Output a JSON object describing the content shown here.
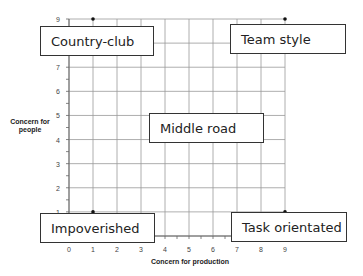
{
  "chart_data": {
    "type": "scatter",
    "title": "",
    "xlabel": "Concern for production",
    "ylabel": "Concern for people",
    "xlim": [
      0,
      9
    ],
    "ylim": [
      0,
      9
    ],
    "grid": true,
    "x_ticks": [
      "0",
      "1",
      "2",
      "3",
      "4",
      "5",
      "6",
      "7",
      "8",
      "9"
    ],
    "y_ticks": [
      "1",
      "2",
      "3",
      "4",
      "5",
      "6",
      "7",
      "9"
    ],
    "points": [
      {
        "x": 1,
        "y": 9,
        "label": "Country-club"
      },
      {
        "x": 9,
        "y": 9,
        "label": "Team style"
      },
      {
        "x": 5,
        "y": 5,
        "label": "Middle road"
      },
      {
        "x": 1,
        "y": 1,
        "label": "Impoverished"
      },
      {
        "x": 9,
        "y": 1,
        "label": "Task orientated"
      }
    ]
  },
  "labels": {
    "country_club": "Country-club",
    "team_style": "Team style",
    "middle_road": "Middle road",
    "impoverished": "Impoverished",
    "task_orientated": "Task orientated"
  },
  "axes": {
    "x_title": "Concern for production",
    "y_title_line1": "Concern for",
    "y_title_line2": "people"
  }
}
